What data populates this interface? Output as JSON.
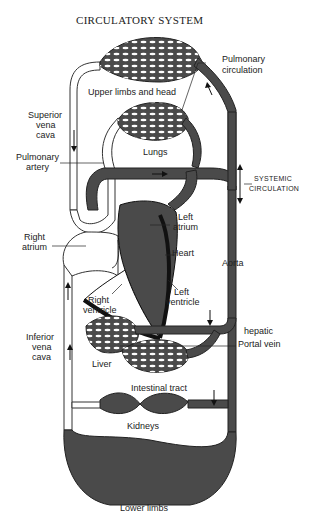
{
  "title": "CIRCULATORY SYSTEM",
  "labels": {
    "pulmonary_circulation_1": "Pulmonary",
    "pulmonary_circulation_2": "circulation",
    "upper_limbs": "Upper limbs and head",
    "superior_vena_cava_1": "Superior",
    "superior_vena_cava_2": "vena",
    "superior_vena_cava_3": "cava",
    "lungs": "Lungs",
    "pulmonary_artery_1": "Pulmonary",
    "pulmonary_artery_2": "artery",
    "systemic_circulation_1": "SYSTEMIC",
    "systemic_circulation_2": "CIRCULATION",
    "right_atrium_1": "Right",
    "right_atrium_2": "atrium",
    "left_atrium_1": "Left",
    "left_atrium_2": "atrium",
    "heart": "Heart",
    "aorta": "Aorta",
    "right_ventricle_1": "Right",
    "right_ventricle_2": "ventricle",
    "left_ventricle_1": "Left",
    "left_ventricle_2": "ventricle",
    "hepatic": "hepatic",
    "portal_vein": "Portal vein",
    "inferior_vena_cava_1": "Inferior",
    "inferior_vena_cava_2": "vena",
    "inferior_vena_cava_3": "cava",
    "liver": "Liver",
    "intestinal_tract": "Intestinal tract",
    "kidneys": "Kidneys",
    "lower_limbs": "Lower limbs"
  },
  "colors": {
    "oxygenated": "#4a4a4a",
    "deoxygenated": "#ffffff",
    "outline": "#222222"
  }
}
